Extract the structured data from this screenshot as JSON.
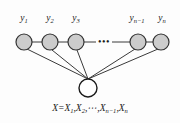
{
  "figure": {
    "background_color": "#fdfdfd",
    "width": 180,
    "height": 123
  },
  "style": {
    "hidden_node_fill": "#cccccc",
    "hidden_node_stroke": "#333333",
    "observed_node_fill": "#ffffff",
    "observed_node_stroke": "#1a1a1a",
    "edge_color": "#3a3a3a",
    "text_color": "#1a1a1a"
  },
  "top_nodes": [
    {
      "id": "y1",
      "label_base": "y",
      "label_sub": "1",
      "cx": 24,
      "cy": 42,
      "r": 8
    },
    {
      "id": "y2",
      "label_base": "y",
      "label_sub": "2",
      "cx": 50,
      "cy": 42,
      "r": 8
    },
    {
      "id": "y3",
      "label_base": "y",
      "label_sub": "3",
      "cx": 76,
      "cy": 42,
      "r": 8
    },
    {
      "id": "yn-1",
      "label_base": "y",
      "label_sub": "n−1",
      "cx": 138,
      "cy": 42,
      "r": 8
    },
    {
      "id": "yn",
      "label_base": "y",
      "label_sub": "n",
      "cx": 161,
      "cy": 42,
      "r": 8
    }
  ],
  "chain_ellipsis": {
    "glyph": "•••",
    "cx": 104,
    "cy": 42
  },
  "bottom_node": {
    "id": "X",
    "cx": 88,
    "cy": 88,
    "r": 9,
    "apex_x": 88,
    "apex_y": 79
  },
  "equation": {
    "text": "X = X1, X2, ⋯, Xn−1, Xn",
    "lhs": "X",
    "equals": "=",
    "terms": [
      {
        "base": "X",
        "sub": "1"
      },
      {
        "base": "X",
        "sub": "2"
      },
      {
        "base": "⋯",
        "sub": ""
      },
      {
        "base": "X",
        "sub": "n−1"
      },
      {
        "base": "X",
        "sub": "n"
      }
    ],
    "y": 104
  }
}
